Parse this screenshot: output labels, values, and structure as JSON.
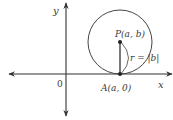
{
  "diagram": {
    "type": "circle-tangent-to-x-axis",
    "colors": {
      "stroke": "#333333",
      "text": "#3a3a3a",
      "background": "#ffffff"
    },
    "axes": {
      "x_label": "x",
      "y_label": "y",
      "origin_label": "0"
    },
    "points": {
      "center": {
        "label": "P(a, b)"
      },
      "tangent": {
        "label": "A(a, 0)"
      }
    },
    "radius_label": "r = |b|"
  }
}
